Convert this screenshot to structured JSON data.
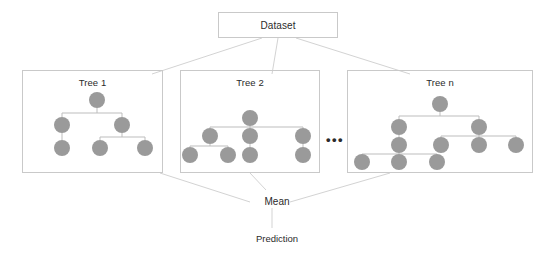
{
  "diagram": {
    "colors": {
      "node_fill": "#9a9a9a",
      "box_border": "#c9c9c9",
      "edge_line": "#bdbdbd",
      "text": "#2b2b2b",
      "background": "#ffffff"
    }
  },
  "dataset": {
    "label": "Dataset"
  },
  "trees": [
    {
      "id": "tree1",
      "label": "Tree 1",
      "nodes": [
        {
          "name": "root",
          "x": 97,
          "y": 100
        },
        {
          "name": "n-l",
          "x": 62,
          "y": 125
        },
        {
          "name": "n-r",
          "x": 122,
          "y": 125
        },
        {
          "name": "n-l-1",
          "x": 62,
          "y": 148
        },
        {
          "name": "n-r-1",
          "x": 100,
          "y": 148
        },
        {
          "name": "n-r-2",
          "x": 145,
          "y": 148
        }
      ],
      "edges": [
        {
          "from": "root",
          "to": "n-l"
        },
        {
          "from": "root",
          "to": "n-r"
        },
        {
          "from": "n-l",
          "to": "n-l-1"
        },
        {
          "from": "n-r",
          "to": "n-r-1"
        },
        {
          "from": "n-r",
          "to": "n-r-2"
        }
      ]
    },
    {
      "id": "tree2",
      "label": "Tree 2",
      "nodes": [
        {
          "name": "root",
          "x": 250,
          "y": 118
        },
        {
          "name": "c-l",
          "x": 210,
          "y": 136
        },
        {
          "name": "c-m",
          "x": 250,
          "y": 136
        },
        {
          "name": "c-r",
          "x": 303,
          "y": 136
        },
        {
          "name": "c-l-1",
          "x": 190,
          "y": 155
        },
        {
          "name": "c-l-2",
          "x": 228,
          "y": 155
        },
        {
          "name": "c-m-1",
          "x": 250,
          "y": 155
        },
        {
          "name": "c-r-1",
          "x": 303,
          "y": 155
        }
      ],
      "edges": [
        {
          "from": "root",
          "to": "c-l"
        },
        {
          "from": "root",
          "to": "c-m"
        },
        {
          "from": "root",
          "to": "c-r"
        },
        {
          "from": "c-l",
          "to": "c-l-1"
        },
        {
          "from": "c-l",
          "to": "c-l-2"
        },
        {
          "from": "c-m",
          "to": "c-m-1"
        },
        {
          "from": "c-r",
          "to": "c-r-1"
        }
      ]
    },
    {
      "id": "treen",
      "label": "Tree n",
      "nodes": [
        {
          "name": "root",
          "x": 440,
          "y": 104
        },
        {
          "name": "a",
          "x": 399,
          "y": 127
        },
        {
          "name": "b",
          "x": 479,
          "y": 127
        },
        {
          "name": "a1",
          "x": 399,
          "y": 145
        },
        {
          "name": "b1",
          "x": 441,
          "y": 145
        },
        {
          "name": "b2",
          "x": 479,
          "y": 145
        },
        {
          "name": "b3",
          "x": 516,
          "y": 145
        },
        {
          "name": "a1-1",
          "x": 362,
          "y": 162
        },
        {
          "name": "a1-2",
          "x": 399,
          "y": 162
        },
        {
          "name": "a1-3",
          "x": 437,
          "y": 162
        }
      ],
      "edges": [
        {
          "from": "root",
          "to": "a"
        },
        {
          "from": "root",
          "to": "b"
        },
        {
          "from": "a",
          "to": "a1"
        },
        {
          "from": "b",
          "to": "b1"
        },
        {
          "from": "b",
          "to": "b2"
        },
        {
          "from": "b",
          "to": "b3"
        },
        {
          "from": "a1",
          "to": "a1-1"
        },
        {
          "from": "a1",
          "to": "a1-2"
        },
        {
          "from": "a1",
          "to": "a1-3"
        }
      ]
    }
  ],
  "ellipsis": {
    "label": "•••"
  },
  "mean": {
    "label": "Mean"
  },
  "prediction": {
    "label": "Prediction"
  },
  "connectors": {
    "dataset_to_trees": [
      {
        "from": [
          262,
          38
        ],
        "to": [
          152,
          74
        ]
      },
      {
        "from": [
          278,
          38
        ],
        "to": [
          272,
          74
        ]
      },
      {
        "from": [
          296,
          38
        ],
        "to": [
          410,
          74
        ]
      }
    ],
    "trees_to_mean": [
      {
        "from": [
          160,
          173
        ],
        "to": [
          250,
          202
        ]
      },
      {
        "from": [
          250,
          173
        ],
        "to": [
          266,
          190
        ]
      },
      {
        "from": [
          390,
          173
        ],
        "to": [
          290,
          202
        ]
      }
    ],
    "mean_to_prediction": {
      "from": [
        272,
        208
      ],
      "to": [
        272,
        228
      ]
    }
  }
}
